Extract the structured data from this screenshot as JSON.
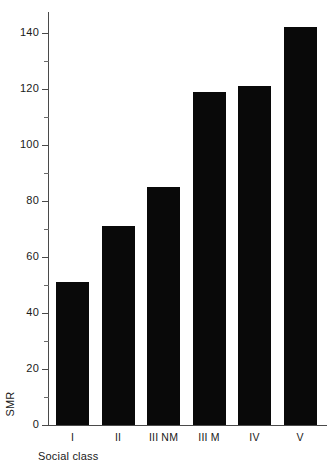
{
  "chart_data": {
    "type": "bar",
    "title": "",
    "subtitle": "",
    "xlabel": "Social class",
    "ylabel": "SMR",
    "categories": [
      "I",
      "II",
      "III NM",
      "III M",
      "IV",
      "V"
    ],
    "values": [
      51,
      71,
      85,
      119,
      121,
      142
    ],
    "series": [
      {
        "name": "SMR",
        "values": [
          51,
          71,
          85,
          119,
          121,
          142
        ]
      }
    ],
    "ylim": [
      0,
      148
    ],
    "xlim_note": "categorical",
    "y_major_ticks": [
      0,
      20,
      40,
      60,
      80,
      100,
      120,
      140
    ],
    "y_tick_labels": [
      "0",
      "20",
      "40",
      "60",
      "80",
      "100",
      "120",
      "140"
    ],
    "y_minor_ticks": [
      10,
      30,
      50,
      70,
      90,
      110,
      130
    ],
    "grid": false,
    "legend": null,
    "legend_position": "none",
    "annotations": [],
    "bar_color": "#090909",
    "axis_color": "#4a4a4a",
    "background_color": "#ffffff"
  },
  "axes": {
    "y_title": "SMR",
    "x_title": "Social class"
  }
}
